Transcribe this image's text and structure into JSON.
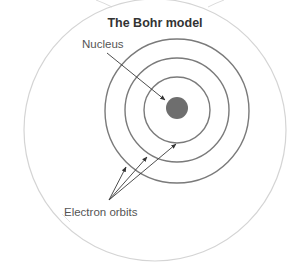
{
  "diagram": {
    "title": "The Bohr model",
    "labels": {
      "nucleus": "Nucleus",
      "electron_orbits": "Electron orbits"
    },
    "nucleus": {
      "cx": 177,
      "cy": 108,
      "r": 11,
      "color": "#6e6e6e"
    },
    "orbits": [
      {
        "name": "orbit-1",
        "cx": 177,
        "cy": 110,
        "r": 33
      },
      {
        "name": "orbit-2",
        "cx": 177,
        "cy": 110,
        "r": 52
      },
      {
        "name": "orbit-3",
        "cx": 177,
        "cy": 111,
        "r": 72
      }
    ],
    "orbit_color": "#7a7a7a",
    "outer_boundary": {
      "cx": 155,
      "cy": 130,
      "r": 131,
      "color": "#d4d4d4"
    },
    "arrows": {
      "nucleus_arrow": {
        "x1": 107,
        "y1": 53,
        "x2": 165,
        "y2": 100
      },
      "orbit_arrows": [
        {
          "x1": 109,
          "y1": 200,
          "x2": 126,
          "y2": 167
        },
        {
          "x1": 109,
          "y1": 200,
          "x2": 147,
          "y2": 157
        },
        {
          "x1": 109,
          "y1": 200,
          "x2": 176,
          "y2": 144
        }
      ],
      "color": "#3a3a3a"
    }
  }
}
